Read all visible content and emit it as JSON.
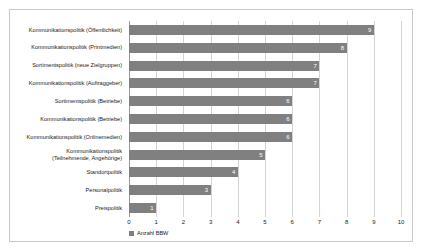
{
  "chart_data": {
    "type": "bar",
    "orientation": "horizontal",
    "title": "",
    "xlabel": "",
    "ylabel": "",
    "xlim": [
      0,
      10
    ],
    "xticks": [
      "0",
      "1",
      "2",
      "3",
      "4",
      "5",
      "6",
      "7",
      "8",
      "9",
      "10"
    ],
    "grid": true,
    "legend_position": "bottom-left",
    "series": [
      {
        "name": "Anzahl BBW",
        "color": "#808080",
        "values": [
          9,
          8,
          7,
          7,
          6,
          6,
          6,
          5,
          4,
          3,
          1
        ]
      }
    ],
    "categories": [
      "Kommunikationspolitik (Öffentlichkeit)",
      "Kommunikationspolitik (Printmedien)",
      "Sortimentspolitik (neue Zielgruppen)",
      "Kommunikationspolitik (Auftraggeber)",
      "Sortimentspolitik (Betriebe)",
      "Kommunikationspolitik (Betriebe)",
      "Kommunikationspolitik (Onlinemedien)",
      "Kommunikationspolitik\n(Teilnehmende, Angehörige)",
      "Standortpolitik",
      "Personalpolitik",
      "Preispolitik"
    ],
    "data_labels": [
      "9",
      "8",
      "7",
      "7",
      "6",
      "6",
      "6",
      "5",
      "4",
      "3",
      "1"
    ]
  },
  "legend": {
    "entries": [
      {
        "label": "Anzahl BBW",
        "color": "#808080"
      }
    ]
  },
  "colors": {
    "bar": "#808080",
    "grid": "#d4d4d4",
    "axis": "#9a9a9a",
    "frame": "#c9c9c9",
    "text": "#1a1a1a",
    "value_label": "#ffffff"
  }
}
